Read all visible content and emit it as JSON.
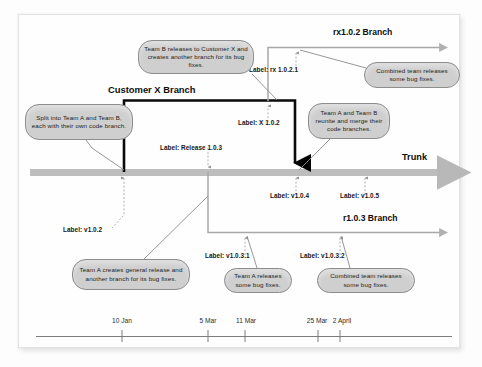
{
  "diagram": {
    "title_branches": {
      "customer_x": "Customer X Branch",
      "rx102": "rx1.0.2 Branch",
      "r103": "r1.0.3 Branch",
      "trunk": "Trunk"
    },
    "colors": {
      "callout_fill": "#cfcfcf",
      "callout_stroke": "#8d8d8d",
      "trunk_line": "#b8b8b8",
      "thin_branch_line": "#9a9a9a",
      "thick_branch_line": "#000000",
      "dashed_pointer": "#a9a9a9",
      "text": "#151515"
    },
    "version_labels": [
      {
        "id": "label-release-103",
        "text": "Label: Release 1.0.3"
      },
      {
        "id": "label-x-102",
        "text": "Label: X 1.0.2"
      },
      {
        "id": "label-rx-1021",
        "text": "Label: rx 1.0.2.1"
      },
      {
        "id": "label-v102",
        "text": "Label: v1.0.2"
      },
      {
        "id": "label-v104",
        "text": "Label: v1.0.4"
      },
      {
        "id": "label-v105",
        "text": "Label: v1.0.5"
      },
      {
        "id": "label-v1031",
        "text": "Label: v1.0.3.1"
      },
      {
        "id": "label-v1032",
        "text": "Label: v1.0.3.2"
      }
    ],
    "callouts": [
      {
        "id": "callout-team-b-release",
        "text": "Team B releases to Customer X and creates another branch for its bug fixes."
      },
      {
        "id": "callout-split-teams",
        "text": "Split into Team A and Team B, each with their own code branch."
      },
      {
        "id": "callout-combined-top",
        "text": "Combined team releases some bug fixes."
      },
      {
        "id": "callout-reunite",
        "text": "Team A and Team B reunite and merge their code branches."
      },
      {
        "id": "callout-team-a-general",
        "text": "Team A creates general release and another branch for its bug fixes."
      },
      {
        "id": "callout-team-a-bugfixes",
        "text": "Team A releases some bug fixes."
      },
      {
        "id": "callout-combined-bottom",
        "text": "Combined team releases some bug fixes."
      }
    ],
    "timeline": {
      "ticks": [
        {
          "label": "10 Jan",
          "x": 122
        },
        {
          "label": "5 Mar",
          "x": 208
        },
        {
          "label": "11 Mar",
          "x": 245
        },
        {
          "label": "25 Mar",
          "x": 318
        },
        {
          "label": "2 April",
          "x": 340
        }
      ]
    }
  }
}
